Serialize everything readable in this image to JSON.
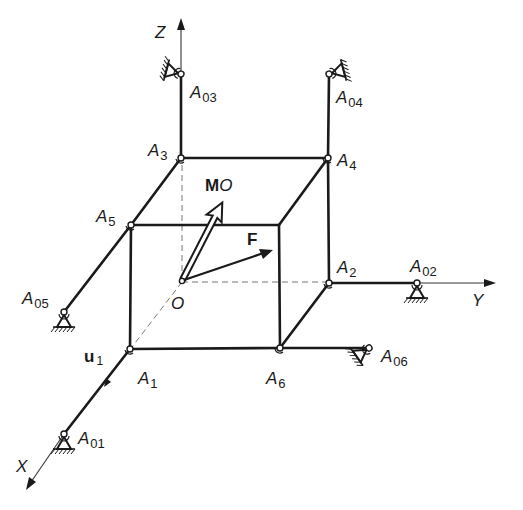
{
  "figure": {
    "type": "3D frame / rigid body supported by six bars",
    "axes": {
      "x": "X",
      "y": "Y",
      "z": "Z"
    },
    "origin": "O",
    "vectors": {
      "moment": {
        "main": "M",
        "sub": "O"
      },
      "force": "F",
      "unit_vector": {
        "main": "u",
        "sub": "1"
      }
    },
    "joints": [
      {
        "main": "A",
        "sub": "1"
      },
      {
        "main": "A",
        "sub": "2"
      },
      {
        "main": "A",
        "sub": "3"
      },
      {
        "main": "A",
        "sub": "4"
      },
      {
        "main": "A",
        "sub": "5"
      },
      {
        "main": "A",
        "sub": "6"
      }
    ],
    "supports": [
      {
        "main": "A",
        "sub": "01"
      },
      {
        "main": "A",
        "sub": "02"
      },
      {
        "main": "A",
        "sub": "03"
      },
      {
        "main": "A",
        "sub": "04"
      },
      {
        "main": "A",
        "sub": "05"
      },
      {
        "main": "A",
        "sub": "06"
      }
    ],
    "colors": {
      "ink": "#1a1a1a",
      "dashed": "#777777",
      "background": "#ffffff"
    }
  }
}
